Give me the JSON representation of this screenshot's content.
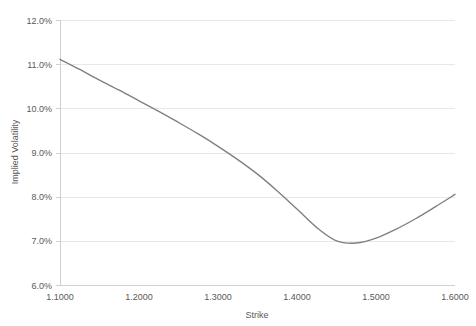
{
  "chart_data": {
    "type": "line",
    "title": "",
    "xlabel": "Strike",
    "ylabel": "Implied Volatility",
    "xlim": [
      1.1,
      1.6
    ],
    "ylim": [
      0.06,
      0.12
    ],
    "grid": true,
    "legend": false,
    "legend_position": "none",
    "x_tick_labels": [
      "1.1000",
      "1.2000",
      "1.3000",
      "1.4000",
      "1.5000",
      "1.6000"
    ],
    "x_tick_values": [
      1.1,
      1.2,
      1.3,
      1.4,
      1.5,
      1.6
    ],
    "y_tick_labels": [
      "6.0%",
      "7.0%",
      "8.0%",
      "9.0%",
      "10.0%",
      "11.0%",
      "12.0%"
    ],
    "y_tick_values": [
      0.06,
      0.07,
      0.08,
      0.09,
      0.1,
      0.11,
      0.12
    ],
    "line_color": "#808080",
    "grid_color": "#e8e8e8",
    "axis_color": "#d0d0d0",
    "text_color": "#595959",
    "background_color": "#ffffff",
    "series": [
      {
        "name": "Implied Volatility",
        "x": [
          1.1,
          1.125,
          1.15,
          1.175,
          1.2,
          1.225,
          1.25,
          1.275,
          1.3,
          1.325,
          1.35,
          1.375,
          1.4,
          1.425,
          1.45,
          1.475,
          1.5,
          1.525,
          1.55,
          1.575,
          1.6
        ],
        "values": [
          0.1111,
          0.1088,
          0.1064,
          0.1041,
          0.1017,
          0.0993,
          0.0968,
          0.0942,
          0.0914,
          0.0884,
          0.0851,
          0.0813,
          0.0772,
          0.073,
          0.07,
          0.0695,
          0.0706,
          0.0726,
          0.075,
          0.0777,
          0.0805
        ]
      }
    ],
    "annotations": []
  },
  "axes": {
    "y_axis_title": "Implied Volatility",
    "x_axis_title": "Strike"
  }
}
